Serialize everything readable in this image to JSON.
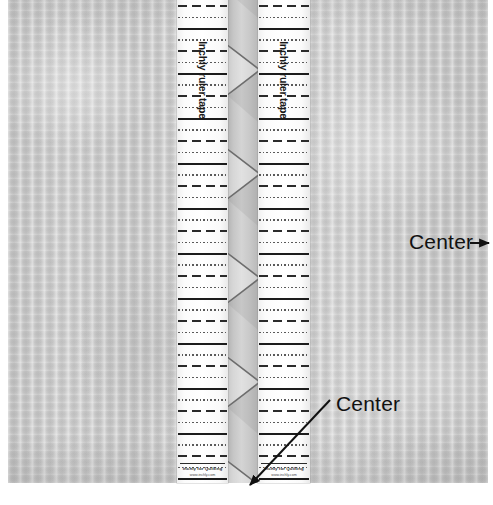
{
  "image": {
    "width": 493,
    "height": 505,
    "subject": "quilting fabric panel with two inch ruler tapes marking a center seam",
    "background_color": "#ffffff",
    "fabric_color": "#c9c9c9",
    "seam_color": "#c2c2c2",
    "tape_color": "#ffffff",
    "mark_color": "#1c1c1c",
    "annotation_color": "#111111"
  },
  "tapes": {
    "left": {
      "label": "Inchly ruler tape",
      "brand": "Inchly for Quilting",
      "url": "www.inchly.com"
    },
    "right": {
      "label": "Inchly ruler tape",
      "brand": "Inchly for Quilting",
      "url": "www.inchly.com"
    },
    "mark_pattern": [
      "dot",
      "dash",
      "dot",
      "solid"
    ],
    "solid_spacing_px": 45
  },
  "annotations": [
    {
      "id": "center-right",
      "text": "Center",
      "arrow": "right",
      "arrow_from": [
        482,
        243
      ],
      "arrow_to": [
        487,
        243
      ]
    },
    {
      "id": "center-bottom",
      "text": "Center",
      "arrow": "down-left",
      "arrow_from": [
        330,
        400
      ],
      "arrow_to": [
        243,
        492
      ]
    }
  ]
}
